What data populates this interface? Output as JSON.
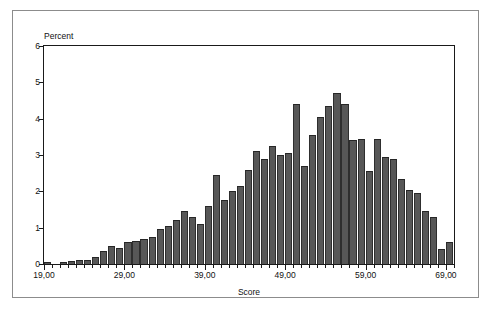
{
  "chart_data": {
    "type": "bar",
    "title": "",
    "subtitle": "",
    "xlabel": "Score",
    "ylabel": "Percent",
    "xlim": [
      19,
      70
    ],
    "ylim": [
      0,
      6
    ],
    "bin_width": 1,
    "grid": false,
    "legend": null,
    "x_tick_labels": [
      "19,00",
      "29,00",
      "39,00",
      "49,00",
      "59,00",
      "69,00"
    ],
    "x_tick_values": [
      19,
      29,
      39,
      49,
      59,
      69
    ],
    "y_tick_labels": [
      "0",
      "1",
      "2",
      "3",
      "4",
      "5",
      "6"
    ],
    "y_tick_values": [
      0,
      1,
      2,
      3,
      4,
      5,
      6
    ],
    "bar_color": "#575757",
    "bar_edge_color": "#262626",
    "axis_color": "#1a1a1a",
    "categories": [
      19,
      20,
      21,
      22,
      23,
      24,
      25,
      26,
      27,
      28,
      29,
      30,
      31,
      32,
      33,
      34,
      35,
      36,
      37,
      38,
      39,
      40,
      41,
      42,
      43,
      44,
      45,
      46,
      47,
      48,
      49,
      50,
      51,
      52,
      53,
      54,
      55,
      56,
      57,
      58,
      59,
      60,
      61,
      62,
      63,
      64,
      65,
      66,
      67,
      68,
      69
    ],
    "values": [
      0.05,
      0.0,
      0.05,
      0.08,
      0.1,
      0.12,
      0.18,
      0.35,
      0.5,
      0.45,
      0.6,
      0.62,
      0.7,
      0.75,
      0.95,
      1.05,
      1.2,
      1.45,
      1.3,
      1.1,
      1.6,
      2.45,
      1.75,
      2.0,
      2.15,
      2.6,
      3.1,
      2.9,
      3.25,
      3.0,
      3.05,
      4.4,
      2.7,
      3.55,
      4.05,
      4.35,
      4.7,
      4.4,
      3.4,
      3.45,
      2.55,
      3.45,
      2.95,
      2.9,
      2.35,
      2.05,
      1.95,
      1.45,
      1.3,
      0.4,
      0.6
    ]
  },
  "axes": {
    "y_title": "Percent",
    "x_title": "Score"
  }
}
